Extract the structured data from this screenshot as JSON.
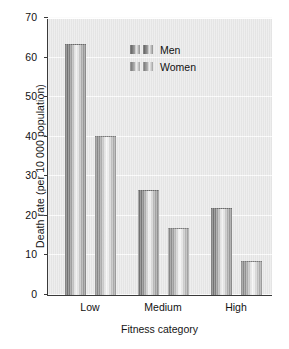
{
  "chart_data": {
    "type": "bar",
    "title": "",
    "xlabel": "Fitness category",
    "ylabel": "Death rate (per 10 000 population)",
    "categories": [
      "Low",
      "Medium",
      "High"
    ],
    "series": [
      {
        "name": "Men",
        "values": [
          63.5,
          26.5,
          22.0
        ]
      },
      {
        "name": "Women",
        "values": [
          40.3,
          17.0,
          8.5
        ]
      }
    ],
    "ylim": [
      0,
      70
    ],
    "yticks": [
      0,
      10,
      20,
      30,
      40,
      50,
      60,
      70
    ],
    "ytick_labels": [
      "0",
      "10",
      "20",
      "30",
      "40",
      "50",
      "60",
      "70"
    ],
    "grid": true,
    "legend_position": "top-right",
    "colors": {
      "panel_background": "#e7e7e7",
      "gridline": "#fbfbfb",
      "axis": "#3a3a3a",
      "bar_men": "#7b7b7b",
      "bar_women": "#949494",
      "text": "#111111"
    }
  },
  "legend": {
    "items": [
      {
        "label": "Men"
      },
      {
        "label": "Women"
      }
    ]
  }
}
